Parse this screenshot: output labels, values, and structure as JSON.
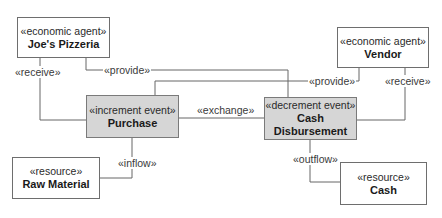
{
  "diagram": {
    "type": "REA model diagram",
    "colors": {
      "event_fill": "#d6d6d6",
      "box_fill": "#ffffff",
      "line": "#666666"
    },
    "nodes": {
      "joes_pizzeria": {
        "stereotype": "«economic agent»",
        "name": "Joe's Pizzeria"
      },
      "vendor": {
        "stereotype": "«economic agent»",
        "name": "Vendor"
      },
      "purchase": {
        "stereotype": "«increment event»",
        "name": "Purchase"
      },
      "cash_disbursement": {
        "stereotype": "«decrement event»",
        "name_line1": "Cash",
        "name_line2": "Disbursement"
      },
      "raw_material": {
        "stereotype": "«resource»",
        "name": "Raw Material"
      },
      "cash": {
        "stereotype": "«resource»",
        "name": "Cash"
      }
    },
    "edges": {
      "joes_receive": {
        "label": "«receive»",
        "from": "Joe's Pizzeria",
        "to": "Purchase"
      },
      "joes_provide": {
        "label": "«provide»",
        "from": "Joe's Pizzeria",
        "to": "Cash Disbursement"
      },
      "vendor_provide": {
        "label": "«provide»",
        "from": "Vendor",
        "to": "Purchase"
      },
      "vendor_receive": {
        "label": "«receive»",
        "from": "Vendor",
        "to": "Cash Disbursement"
      },
      "exchange": {
        "label": "«exchange»",
        "from": "Purchase",
        "to": "Cash Disbursement"
      },
      "inflow": {
        "label": "«inflow»",
        "from": "Raw Material",
        "to": "Purchase"
      },
      "outflow": {
        "label": "«outflow»",
        "from": "Cash Disbursement",
        "to": "Cash"
      }
    }
  }
}
